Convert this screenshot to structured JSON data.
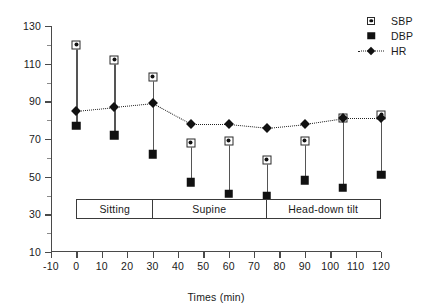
{
  "chart_data": {
    "type": "line",
    "title": "",
    "xlabel": "Times (min)",
    "ylabel": "",
    "xlim": [
      -10,
      120
    ],
    "ylim": [
      10,
      130
    ],
    "xticks": [
      -10,
      0,
      10,
      20,
      30,
      40,
      50,
      60,
      70,
      80,
      90,
      100,
      110,
      120
    ],
    "yticks": [
      10,
      30,
      50,
      70,
      90,
      110,
      130
    ],
    "grid": false,
    "legend_position": "top-right",
    "x": [
      0,
      15,
      30,
      45,
      60,
      75,
      90,
      105,
      120
    ],
    "series": [
      {
        "name": "SBP",
        "marker": "square-with-dot",
        "values": [
          120,
          112,
          103,
          68,
          69,
          59,
          69,
          81,
          83
        ]
      },
      {
        "name": "DBP",
        "marker": "filled-square",
        "values": [
          77,
          72,
          62,
          47,
          41,
          40,
          48,
          44,
          51
        ]
      },
      {
        "name": "HR",
        "marker": "diamond-dotted-line",
        "values": [
          85,
          87,
          89,
          78,
          78,
          76,
          78,
          81,
          81
        ]
      }
    ],
    "annotations": {
      "phases": [
        {
          "label": "Sitting",
          "start": 0,
          "end": 30
        },
        {
          "label": "Supine",
          "start": 30,
          "end": 75
        },
        {
          "label": "Head-down tilt",
          "start": 75,
          "end": 120
        }
      ]
    }
  },
  "legend": {
    "items": [
      {
        "label": "SBP",
        "key": "square-with-dot-icon"
      },
      {
        "label": "DBP",
        "key": "filled-square-icon"
      },
      {
        "label": "HR",
        "key": "diamond-line-icon"
      }
    ]
  },
  "colors": {
    "axis": "#4a4a4a",
    "marker": "#111111",
    "background": "#ffffff"
  }
}
